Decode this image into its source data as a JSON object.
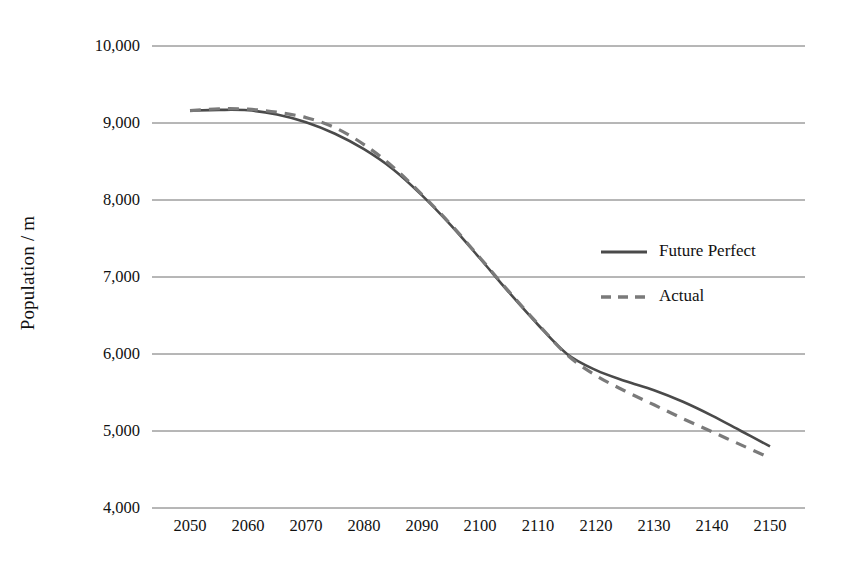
{
  "chart_data": {
    "type": "line",
    "title": "",
    "xlabel": "",
    "ylabel": "Population / m",
    "xlim": [
      2050,
      2150
    ],
    "ylim": [
      4000,
      10000
    ],
    "grid": "horizontal",
    "legend_position": "center-right",
    "x_ticks": [
      2050,
      2060,
      2070,
      2080,
      2090,
      2100,
      2110,
      2120,
      2130,
      2140,
      2150
    ],
    "x_tick_labels": [
      "2050",
      "2060",
      "2070",
      "2080",
      "2090",
      "2100",
      "2110",
      "2120",
      "2130",
      "2140",
      "2150"
    ],
    "y_ticks": [
      4000,
      5000,
      6000,
      7000,
      8000,
      9000,
      10000
    ],
    "y_tick_labels": [
      "4,000",
      "5,000",
      "6,000",
      "7,000",
      "8,000",
      "9,000",
      "10,000"
    ],
    "x": [
      2050,
      2055,
      2060,
      2065,
      2070,
      2075,
      2080,
      2085,
      2090,
      2095,
      2100,
      2105,
      2110,
      2115,
      2120,
      2125,
      2130,
      2135,
      2140,
      2145,
      2150
    ],
    "series": [
      {
        "name": "Future Perfect",
        "style": "solid",
        "color": "#4a4a4a",
        "values": [
          9160,
          9170,
          9165,
          9110,
          9010,
          8860,
          8660,
          8400,
          8060,
          7670,
          7240,
          6800,
          6380,
          6000,
          5790,
          5650,
          5530,
          5380,
          5200,
          5000,
          4800
        ]
      },
      {
        "name": "Actual",
        "style": "dashed",
        "color": "#7a7a7a",
        "values": [
          9160,
          9185,
          9180,
          9140,
          9070,
          8940,
          8720,
          8430,
          8070,
          7680,
          7250,
          6810,
          6390,
          5990,
          5720,
          5520,
          5340,
          5160,
          4990,
          4820,
          4650
        ]
      }
    ]
  },
  "legend": {
    "items": [
      {
        "label": "Future Perfect",
        "style": "solid",
        "color": "#4a4a4a"
      },
      {
        "label": "Actual",
        "style": "dashed",
        "color": "#7a7a7a"
      }
    ]
  },
  "colors": {
    "gridline": "#6e6e6e",
    "future_perfect": "#4a4a4a",
    "actual": "#7a7a7a",
    "text": "#111111",
    "background": "#ffffff"
  }
}
